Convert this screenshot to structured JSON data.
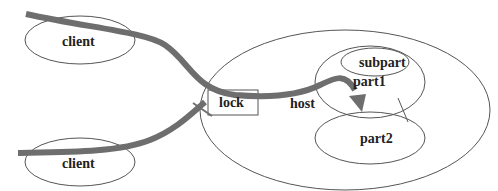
{
  "diagram": {
    "colors": {
      "outline": "#555555",
      "path": "#6e6e6e",
      "text": "#222222"
    },
    "nodes": [
      {
        "id": "client-top",
        "label": "client",
        "shape": "ellipse"
      },
      {
        "id": "client-bottom",
        "label": "client",
        "shape": "ellipse"
      },
      {
        "id": "host",
        "label": "host",
        "shape": "ellipse"
      },
      {
        "id": "lock",
        "label": "lock",
        "shape": "rectangle"
      },
      {
        "id": "part1",
        "label": "part1",
        "shape": "ellipse"
      },
      {
        "id": "subpart",
        "label": "subpart",
        "shape": "ellipse"
      },
      {
        "id": "part2",
        "label": "part2",
        "shape": "ellipse"
      }
    ],
    "edges": [
      {
        "from": "client-top",
        "to": "part2",
        "via": "lock",
        "style": "thick-arrow"
      },
      {
        "from": "client-bottom",
        "to": "lock",
        "style": "thick-blocked"
      },
      {
        "from": "part1",
        "to": "part2",
        "style": "thin-line"
      }
    ]
  }
}
